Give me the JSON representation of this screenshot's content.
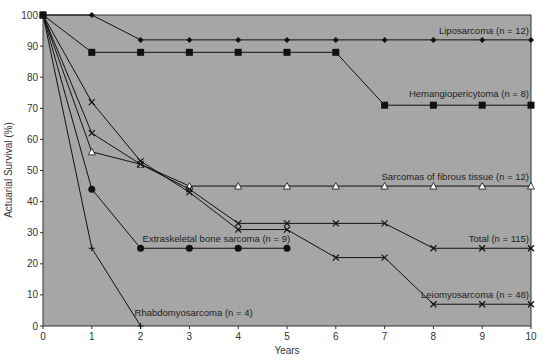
{
  "chart_data": {
    "type": "line",
    "title": "",
    "xlabel": "Years",
    "ylabel": "Actuarial Survival (%)",
    "xlim": [
      0,
      10
    ],
    "ylim": [
      0,
      100
    ],
    "x_ticks": [
      0,
      1,
      2,
      3,
      4,
      5,
      6,
      7,
      8,
      9,
      10
    ],
    "y_ticks": [
      0,
      10,
      20,
      30,
      40,
      50,
      60,
      70,
      80,
      90,
      100
    ],
    "grid": false,
    "plot_background": "#a6a6a6",
    "series": [
      {
        "name": "Liposarcoma (n = 12)",
        "marker": "diamond",
        "x": [
          0,
          1,
          2,
          3,
          4,
          5,
          6,
          7,
          8,
          9,
          10
        ],
        "values": [
          100,
          100,
          92,
          92,
          92,
          92,
          92,
          92,
          92,
          92,
          92
        ],
        "label_pos": [
          10,
          92
        ]
      },
      {
        "name": "Hemangiopericytoma (n = 8)",
        "marker": "square",
        "x": [
          0,
          1,
          2,
          3,
          4,
          5,
          6,
          7,
          8,
          9,
          10
        ],
        "values": [
          100,
          88,
          88,
          88,
          88,
          88,
          88,
          71,
          71,
          71,
          71
        ],
        "label_pos": [
          10,
          71
        ]
      },
      {
        "name": "Sarcomas of fibrous tissue (n = 12)",
        "marker": "triangle",
        "x": [
          0,
          1,
          2,
          3,
          4,
          5,
          6,
          7,
          8,
          9,
          10
        ],
        "values": [
          100,
          56,
          52,
          45,
          45,
          45,
          45,
          45,
          45,
          45,
          45
        ],
        "label_pos": [
          10,
          45
        ]
      },
      {
        "name": "Total (n = 115)",
        "marker": "x",
        "x": [
          0,
          1,
          2,
          3,
          4,
          5,
          6,
          7,
          8,
          9,
          10
        ],
        "values": [
          100,
          62,
          52,
          44,
          33,
          33,
          33,
          33,
          25,
          25,
          25
        ],
        "label_pos": [
          10,
          25
        ]
      },
      {
        "name": "Leiomyosarcoma (n = 48)",
        "marker": "x",
        "x": [
          0,
          1,
          2,
          3,
          4,
          5,
          6,
          7,
          8,
          9,
          10
        ],
        "values": [
          100,
          72,
          53,
          43,
          31,
          31,
          22,
          22,
          7,
          7,
          7
        ],
        "label_pos": [
          10,
          7
        ]
      },
      {
        "name": "Extraskeletal bone sarcoma (n = 9)",
        "marker": "circle",
        "x": [
          0,
          1,
          2,
          3,
          4,
          5
        ],
        "values": [
          100,
          44,
          25,
          25,
          25,
          25
        ],
        "label_pos": [
          2,
          25
        ]
      },
      {
        "name": "Rhabdomyosarcoma (n = 4)",
        "marker": "plus",
        "x": [
          0,
          1,
          2
        ],
        "values": [
          100,
          25,
          0
        ],
        "label_pos": [
          2,
          0
        ]
      }
    ]
  },
  "labels": {
    "xlabel": "Years",
    "ylabel": "Actuarial Survival (%)"
  }
}
